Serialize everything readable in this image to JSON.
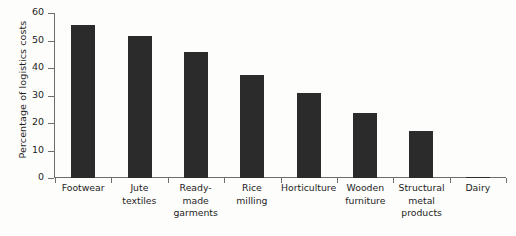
{
  "chart_data": {
    "type": "bar",
    "title": "",
    "subtitle": "",
    "xlabel": "",
    "ylabel": "Percentage of logistics costs",
    "ylim": [
      0,
      60
    ],
    "yticks": [
      0,
      10,
      20,
      30,
      40,
      50,
      60
    ],
    "grid": false,
    "legend": null,
    "bar_color": "#2b2b2b",
    "axis_color": "#6e6e6e",
    "background_color": "#fdfdfc",
    "categories": [
      "Footwear",
      "Jute textiles",
      "Ready-made garments",
      "Rice milling",
      "Horticulture",
      "Wooden furniture",
      "Structural metal products",
      "Dairy"
    ],
    "category_lines": [
      [
        "Footwear"
      ],
      [
        "Jute",
        "textiles"
      ],
      [
        "Ready-made",
        "garments"
      ],
      [
        "Rice",
        "milling"
      ],
      [
        "Horticulture"
      ],
      [
        "Wooden",
        "furniture"
      ],
      [
        "Structural",
        "metal",
        "products"
      ],
      [
        "Dairy"
      ]
    ],
    "values": [
      55.5,
      51.5,
      46,
      37.5,
      31,
      23.5,
      17,
      0.5
    ]
  }
}
